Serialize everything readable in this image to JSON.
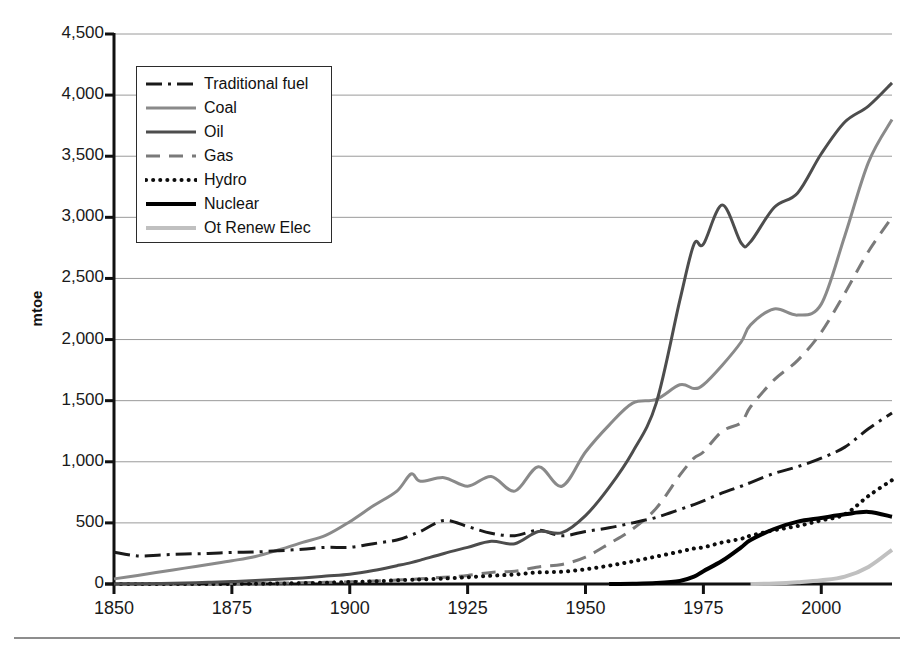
{
  "chart_data": {
    "type": "line",
    "title": "",
    "subtitle": "",
    "xlabel": "",
    "ylabel": "mtoe",
    "xlim": [
      1850,
      2015
    ],
    "ylim": [
      0,
      4500
    ],
    "grid": true,
    "grid_axis": "y",
    "legend_position": "upper-left-inside",
    "xticks": [
      1850,
      1875,
      1900,
      1925,
      1950,
      1975,
      2000
    ],
    "xtick_labels": [
      "1850",
      "1875",
      "1900",
      "1925",
      "1950",
      "1975",
      "2000"
    ],
    "yticks": [
      0,
      500,
      1000,
      1500,
      2000,
      2500,
      3000,
      3500,
      4000,
      4500
    ],
    "ytick_labels": [
      "0",
      "500",
      "1,000",
      "1,500",
      "2,000",
      "2,500",
      "3,000",
      "3,500",
      "4,000",
      "4,500"
    ],
    "x": [
      1850,
      1855,
      1860,
      1865,
      1870,
      1875,
      1880,
      1885,
      1890,
      1895,
      1900,
      1905,
      1910,
      1913,
      1915,
      1920,
      1925,
      1930,
      1935,
      1940,
      1945,
      1950,
      1955,
      1960,
      1965,
      1970,
      1973,
      1975,
      1979,
      1983,
      1985,
      1990,
      1995,
      2000,
      2005,
      2010,
      2015
    ],
    "series": [
      {
        "name": "Traditional fuel",
        "key": "traditional_fuel",
        "color": "#1a1a1a",
        "dash": "dash-dot",
        "width": 3,
        "values": [
          260,
          230,
          238,
          245,
          250,
          258,
          262,
          272,
          285,
          300,
          300,
          330,
          360,
          400,
          430,
          520,
          470,
          415,
          395,
          440,
          395,
          430,
          460,
          500,
          545,
          610,
          650,
          680,
          745,
          800,
          830,
          905,
          960,
          1030,
          1120,
          1270,
          1400
        ]
      },
      {
        "name": "Coal",
        "key": "coal",
        "color": "#8a8a8a",
        "dash": "solid",
        "width": 3,
        "values": [
          42,
          70,
          100,
          130,
          160,
          190,
          225,
          280,
          340,
          400,
          510,
          640,
          760,
          900,
          840,
          870,
          800,
          880,
          760,
          960,
          800,
          1080,
          1300,
          1480,
          1510,
          1630,
          1600,
          1630,
          1790,
          1980,
          2120,
          2250,
          2200,
          2290,
          2850,
          3450,
          3800
        ]
      },
      {
        "name": "Oil",
        "key": "oil",
        "color": "#4d4d4d",
        "dash": "solid",
        "width": 3,
        "values": [
          0,
          2,
          5,
          9,
          14,
          20,
          28,
          38,
          50,
          65,
          80,
          110,
          150,
          175,
          195,
          250,
          300,
          350,
          330,
          430,
          420,
          560,
          790,
          1080,
          1480,
          2320,
          2780,
          2780,
          3100,
          2790,
          2800,
          3080,
          3200,
          3520,
          3780,
          3910,
          4100
        ]
      },
      {
        "name": "Gas",
        "key": "gas",
        "color": "#7a7a7a",
        "dash": "dashed",
        "width": 3,
        "values": [
          0,
          0,
          1,
          2,
          3,
          4,
          6,
          8,
          10,
          14,
          18,
          24,
          32,
          38,
          42,
          55,
          70,
          95,
          105,
          140,
          160,
          220,
          330,
          450,
          620,
          890,
          1030,
          1080,
          1250,
          1320,
          1450,
          1670,
          1830,
          2060,
          2380,
          2720,
          3000
        ]
      },
      {
        "name": "Hydro",
        "key": "hydro",
        "color": "#0d0d0d",
        "dash": "dotted",
        "width": 4,
        "values": [
          0,
          0,
          0,
          0,
          0,
          1,
          2,
          4,
          7,
          11,
          16,
          22,
          30,
          35,
          38,
          45,
          55,
          68,
          78,
          95,
          100,
          120,
          150,
          185,
          225,
          265,
          290,
          300,
          340,
          370,
          395,
          440,
          475,
          520,
          570,
          720,
          850
        ]
      },
      {
        "name": "Nuclear",
        "key": "nuclear",
        "color": "#000000",
        "dash": "solid",
        "width": 4,
        "values": [
          0,
          0,
          0,
          0,
          0,
          0,
          0,
          0,
          0,
          0,
          0,
          0,
          0,
          0,
          0,
          0,
          0,
          0,
          0,
          0,
          0,
          0,
          0,
          2,
          8,
          25,
          60,
          105,
          190,
          300,
          360,
          450,
          510,
          540,
          570,
          590,
          550
        ]
      },
      {
        "name": "Ot Renew Elec",
        "key": "ot_renew_elec",
        "color": "#c0c0c0",
        "dash": "solid",
        "width": 4,
        "values": [
          0,
          0,
          0,
          0,
          0,
          0,
          0,
          0,
          0,
          0,
          0,
          0,
          0,
          0,
          0,
          0,
          0,
          0,
          0,
          0,
          0,
          0,
          0,
          0,
          0,
          0,
          0,
          0,
          0,
          0,
          0,
          5,
          15,
          30,
          60,
          140,
          280
        ]
      }
    ]
  },
  "axes": {
    "y_axis_label": "mtoe"
  },
  "legend": {
    "items": [
      {
        "label": "Traditional fuel",
        "swatch": "dash-dot-line",
        "color": "#1a1a1a"
      },
      {
        "label": "Coal",
        "swatch": "solid-line",
        "color": "#8a8a8a"
      },
      {
        "label": "Oil",
        "swatch": "solid-line",
        "color": "#4d4d4d"
      },
      {
        "label": "Gas",
        "swatch": "dashed-line",
        "color": "#7a7a7a"
      },
      {
        "label": "Hydro",
        "swatch": "dotted-line",
        "color": "#0d0d0d"
      },
      {
        "label": "Nuclear",
        "swatch": "solid-line",
        "color": "#000000"
      },
      {
        "label": "Ot Renew Elec",
        "swatch": "solid-line",
        "color": "#c0c0c0"
      }
    ]
  }
}
